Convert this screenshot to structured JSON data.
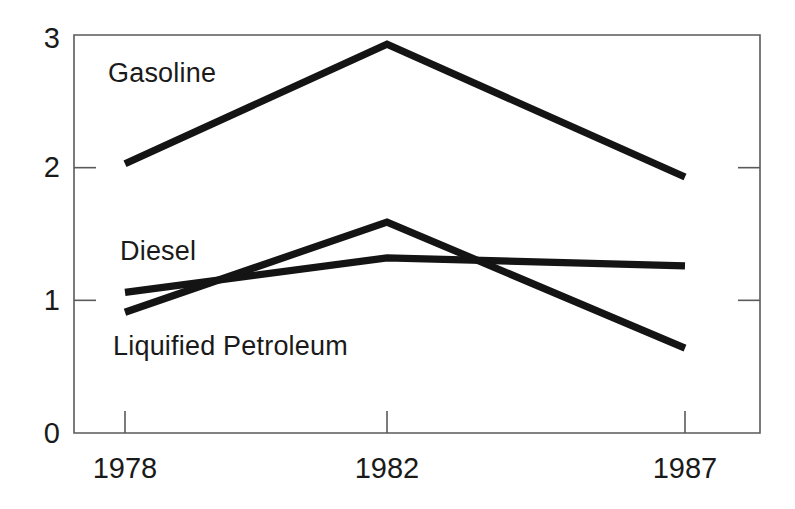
{
  "chart_data": {
    "type": "line",
    "title": "",
    "subtitle": "",
    "xlabel": "",
    "ylabel": "",
    "x": [
      1978,
      1982,
      1987
    ],
    "categories": [
      "1978",
      "1982",
      "1987"
    ],
    "xtick_labels": [
      "1978",
      "1982",
      "1987"
    ],
    "ytick_labels": [
      "0",
      "1",
      "2",
      "3"
    ],
    "ytick_values": [
      0,
      1,
      2,
      3
    ],
    "xlim": [
      1976.1,
      1988.6
    ],
    "ylim": [
      0,
      3
    ],
    "grid": false,
    "legend": "inline-labels",
    "legend_position": "inline",
    "series": [
      {
        "name": "Gasoline",
        "label": "Gasoline",
        "values": [
          2.03,
          2.93,
          1.93
        ],
        "color": "#141414"
      },
      {
        "name": "Diesel",
        "label": "Diesel",
        "values": [
          1.06,
          1.32,
          1.26
        ],
        "color": "#141414"
      },
      {
        "name": "Liquified Petroleum",
        "label": "Liquified Petroleum",
        "values": [
          0.91,
          1.59,
          0.64
        ],
        "color": "#141414"
      }
    ],
    "annotations": [
      {
        "text": "Gasoline",
        "x_px": 108,
        "y_px": 82
      },
      {
        "text": "Diesel",
        "x_px": 120,
        "y_px": 260
      },
      {
        "text": "Liquified Petroleum",
        "x_px": 113,
        "y_px": 355
      }
    ],
    "axis_color": "#5a5a5a",
    "line_color": "#141414",
    "background_color": "#ffffff"
  },
  "geometry": {
    "plot_left_px": 74,
    "plot_right_px": 760,
    "plot_top_px": 35,
    "plot_bottom_px": 433,
    "x_tick_px": [
      125,
      387,
      685
    ],
    "y_tick_px": [
      433,
      300,
      167,
      35
    ]
  }
}
